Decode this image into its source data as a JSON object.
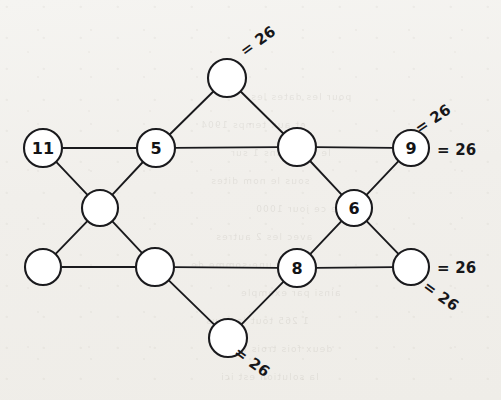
{
  "figure": {
    "type": "magic-star-graph",
    "title": "",
    "magic_constant": 26,
    "stroke_color": "#1a1a1d",
    "node_fill": "#ffffff",
    "background_color": "#f1efeb",
    "canvas": {
      "width": 501,
      "height": 400
    }
  },
  "nodes": [
    {
      "id": "top",
      "label": "",
      "cx": 227,
      "cy": 78,
      "r": 19,
      "filled": false
    },
    {
      "id": "left-outer",
      "label": "11",
      "cx": 43,
      "cy": 148,
      "r": 19,
      "filled": true
    },
    {
      "id": "upper-left",
      "label": "5",
      "cx": 156,
      "cy": 148,
      "r": 19,
      "filled": true
    },
    {
      "id": "upper-right",
      "label": "",
      "cx": 297,
      "cy": 147,
      "r": 19,
      "filled": false
    },
    {
      "id": "right-outer",
      "label": "9",
      "cx": 411,
      "cy": 148,
      "r": 18,
      "filled": true
    },
    {
      "id": "mid-left",
      "label": "",
      "cx": 100,
      "cy": 208,
      "r": 18,
      "filled": false
    },
    {
      "id": "mid-right",
      "label": "6",
      "cx": 354,
      "cy": 208,
      "r": 18,
      "filled": true
    },
    {
      "id": "left-lower",
      "label": "",
      "cx": 43,
      "cy": 267,
      "r": 18,
      "filled": false
    },
    {
      "id": "lower-left",
      "label": "",
      "cx": 155,
      "cy": 267,
      "r": 19,
      "filled": false
    },
    {
      "id": "lower-right",
      "label": "8",
      "cx": 297,
      "cy": 268,
      "r": 19,
      "filled": true
    },
    {
      "id": "right-lower",
      "label": "",
      "cx": 411,
      "cy": 267,
      "r": 18,
      "filled": false
    },
    {
      "id": "bottom",
      "label": "",
      "cx": 228,
      "cy": 338,
      "r": 19,
      "filled": false
    }
  ],
  "edges": [
    {
      "from": "left-outer",
      "to": "upper-left"
    },
    {
      "from": "upper-left",
      "to": "upper-right"
    },
    {
      "from": "upper-right",
      "to": "right-outer"
    },
    {
      "from": "left-lower",
      "to": "lower-left"
    },
    {
      "from": "lower-left",
      "to": "lower-right"
    },
    {
      "from": "lower-right",
      "to": "right-lower"
    },
    {
      "from": "top",
      "to": "upper-left"
    },
    {
      "from": "upper-left",
      "to": "mid-left"
    },
    {
      "from": "mid-left",
      "to": "left-lower"
    },
    {
      "from": "top",
      "to": "upper-right"
    },
    {
      "from": "upper-right",
      "to": "mid-right"
    },
    {
      "from": "mid-right",
      "to": "right-lower"
    },
    {
      "from": "left-outer",
      "to": "mid-left"
    },
    {
      "from": "mid-left",
      "to": "lower-left"
    },
    {
      "from": "lower-left",
      "to": "bottom"
    },
    {
      "from": "bottom",
      "to": "lower-right"
    },
    {
      "from": "lower-right",
      "to": "mid-right"
    },
    {
      "from": "mid-right",
      "to": "right-outer"
    }
  ],
  "sum_labels": [
    {
      "id": "sum-top",
      "text": "= 26",
      "x": 258,
      "y": 41,
      "style": "rot-top"
    },
    {
      "id": "sum-upper-right",
      "text": "= 26",
      "x": 433,
      "y": 119,
      "style": "rot-right"
    },
    {
      "id": "sum-right-upper",
      "text": "= 26",
      "x": 437,
      "y": 150,
      "style": "flat"
    },
    {
      "id": "sum-right-lower",
      "text": "= 26",
      "x": 437,
      "y": 268,
      "style": "flat"
    },
    {
      "id": "sum-bottom-right",
      "text": "= 26",
      "x": 441,
      "y": 296,
      "style": "rot-br"
    },
    {
      "id": "sum-bottom",
      "text": "= 26",
      "x": 252,
      "y": 362,
      "style": "rot-bot"
    }
  ],
  "bleed_through_lines": [
    {
      "text": "pour les dates les",
      "x": 250,
      "y": 92
    },
    {
      "text": "et aux temps 1904",
      "x": 200,
      "y": 120
    },
    {
      "text": "le tout dans 1 sur",
      "x": 230,
      "y": 148
    },
    {
      "text": "sous le nom dites",
      "x": 210,
      "y": 176
    },
    {
      "text": "que ce jour 1000",
      "x": 255,
      "y": 204
    },
    {
      "text": "avec les 2 autres",
      "x": 215,
      "y": 232
    },
    {
      "text": "pour une somme de",
      "x": 190,
      "y": 260
    },
    {
      "text": "ainsi par exemple",
      "x": 240,
      "y": 288
    },
    {
      "text": "1 265 tout la nous",
      "x": 205,
      "y": 316
    },
    {
      "text": "deux fois trois et",
      "x": 235,
      "y": 344
    },
    {
      "text": "la solution est ici",
      "x": 220,
      "y": 372
    }
  ]
}
